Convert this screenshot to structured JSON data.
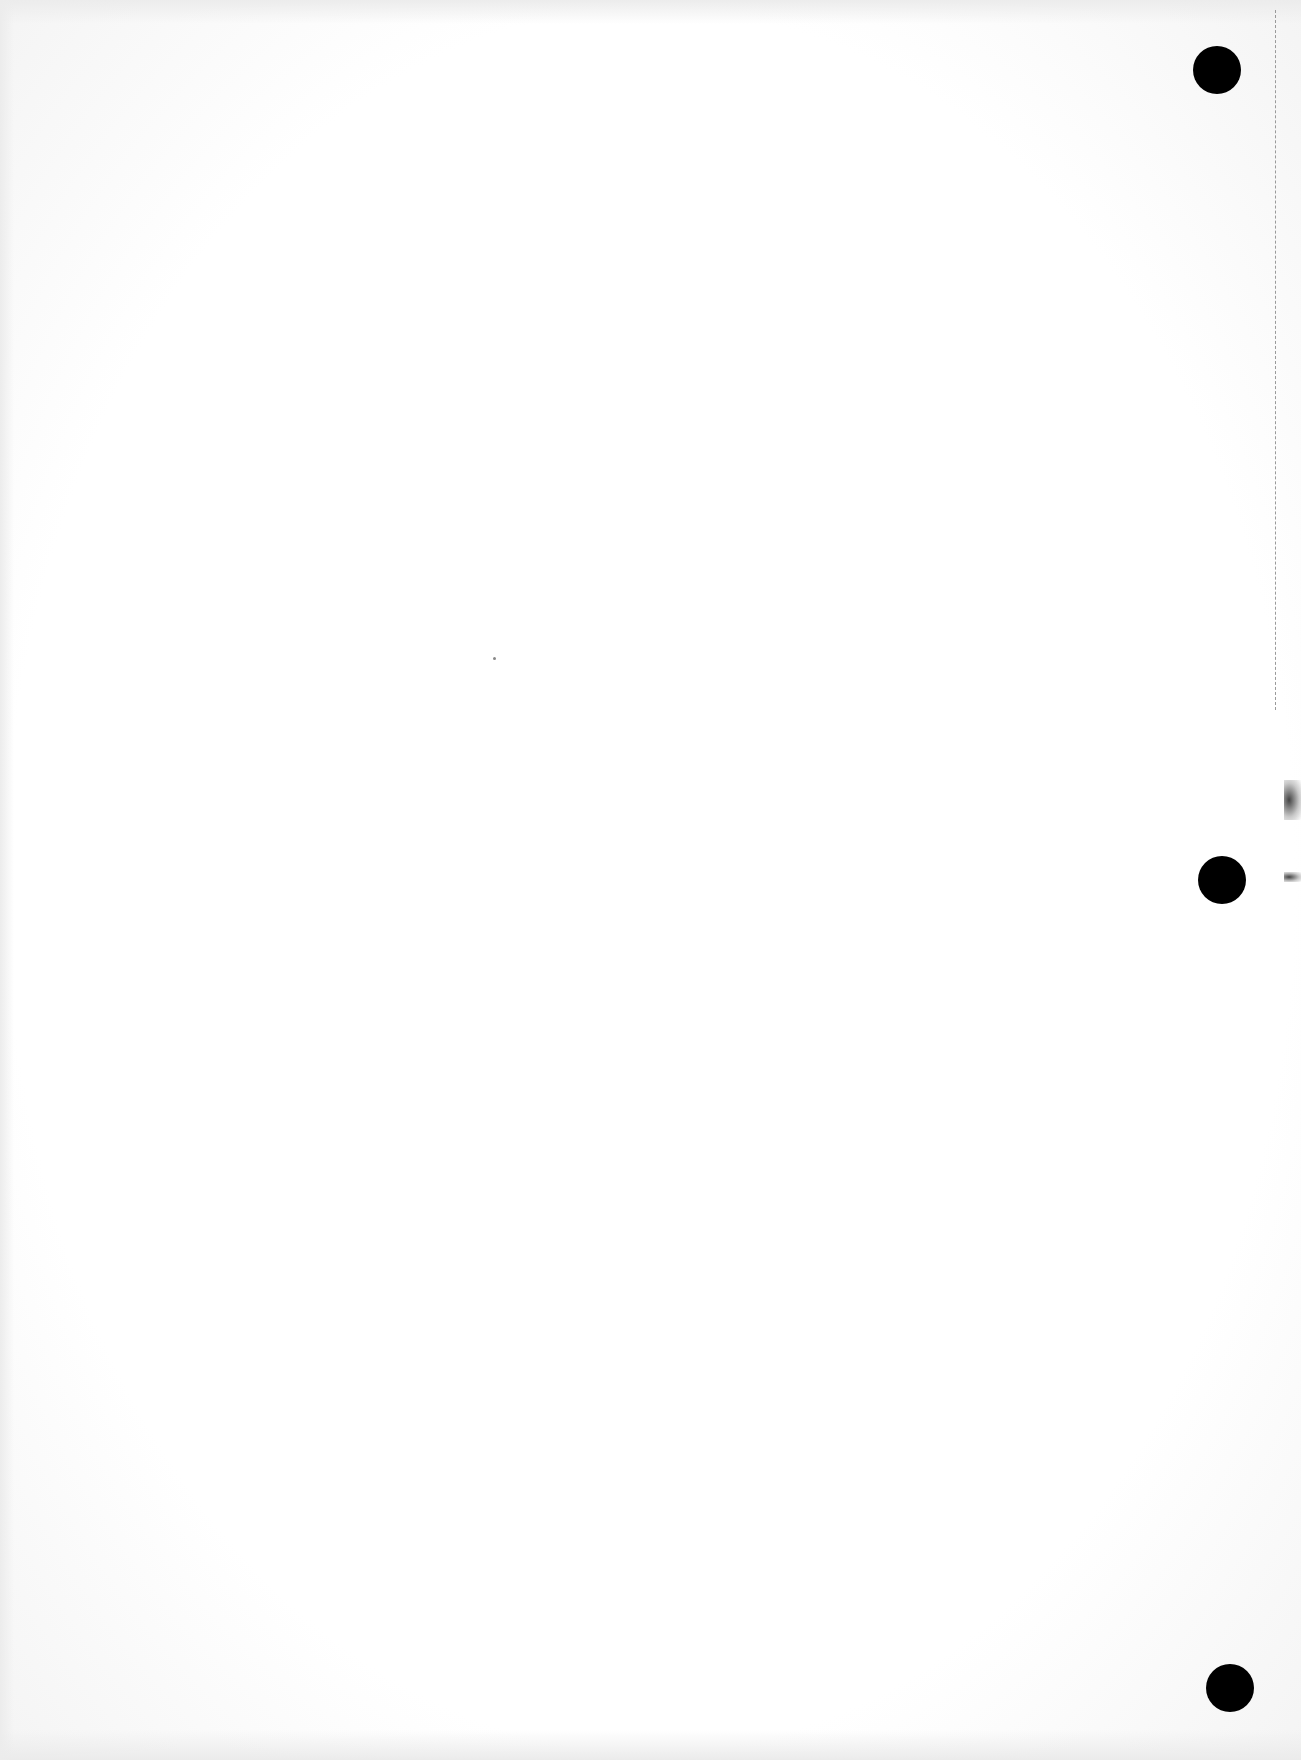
{
  "document": {
    "type": "blank scanned page",
    "text": "",
    "punch_holes": 3
  }
}
